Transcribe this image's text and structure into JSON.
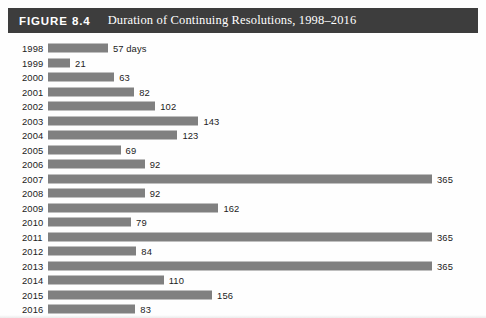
{
  "header": {
    "figure_number": "FIGURE 8.4",
    "title": "Duration of Continuing Resolutions, 1998–2016",
    "band_color": "#3d3d3d",
    "text_color": "#ffffff"
  },
  "chart_data": {
    "type": "bar",
    "orientation": "horizontal",
    "title": "Duration of Continuing Resolutions, 1998–2016",
    "xlabel": "",
    "ylabel": "",
    "unit": "days",
    "bar_color": "#808080",
    "grid": false,
    "legend": "none",
    "xlim": [
      0,
      365
    ],
    "categories": [
      "1998",
      "1999",
      "2000",
      "2001",
      "2002",
      "2003",
      "2004",
      "2005",
      "2006",
      "2007",
      "2008",
      "2009",
      "2010",
      "2011",
      "2012",
      "2013",
      "2014",
      "2015",
      "2016"
    ],
    "values": [
      57,
      21,
      63,
      82,
      102,
      143,
      123,
      69,
      92,
      365,
      92,
      162,
      79,
      365,
      84,
      365,
      110,
      156,
      83
    ],
    "data_labels": [
      "57 days",
      "21",
      "63",
      "82",
      "102",
      "143",
      "123",
      "69",
      "92",
      "365",
      "92",
      "162",
      "79",
      "365",
      "84",
      "365",
      "110",
      "156",
      "83"
    ]
  },
  "rows": [
    {
      "year": "1998",
      "value": 57,
      "label": "57 days"
    },
    {
      "year": "1999",
      "value": 21,
      "label": "21"
    },
    {
      "year": "2000",
      "value": 63,
      "label": "63"
    },
    {
      "year": "2001",
      "value": 82,
      "label": "82"
    },
    {
      "year": "2002",
      "value": 102,
      "label": "102"
    },
    {
      "year": "2003",
      "value": 143,
      "label": "143"
    },
    {
      "year": "2004",
      "value": 123,
      "label": "123"
    },
    {
      "year": "2005",
      "value": 69,
      "label": "69"
    },
    {
      "year": "2006",
      "value": 92,
      "label": "92"
    },
    {
      "year": "2007",
      "value": 365,
      "label": "365"
    },
    {
      "year": "2008",
      "value": 92,
      "label": "92"
    },
    {
      "year": "2009",
      "value": 162,
      "label": "162"
    },
    {
      "year": "2010",
      "value": 79,
      "label": "79"
    },
    {
      "year": "2011",
      "value": 365,
      "label": "365"
    },
    {
      "year": "2012",
      "value": 84,
      "label": "84"
    },
    {
      "year": "2013",
      "value": 365,
      "label": "365"
    },
    {
      "year": "2014",
      "value": 110,
      "label": "110"
    },
    {
      "year": "2015",
      "value": 156,
      "label": "156"
    },
    {
      "year": "2016",
      "value": 83,
      "label": "83"
    }
  ]
}
